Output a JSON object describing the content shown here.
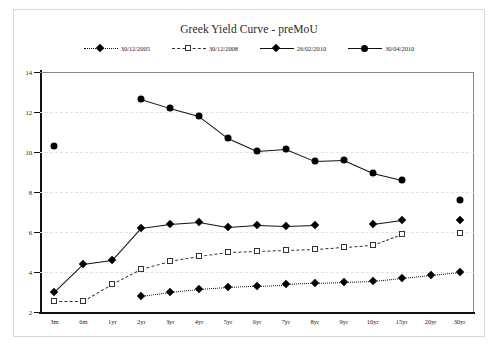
{
  "chart_data": {
    "type": "line",
    "title": "Greek Yield Curve - preMoU",
    "xlabel": "",
    "ylabel": "",
    "ylim": [
      2,
      14
    ],
    "ytick_step": 2,
    "yticks": [
      2,
      4,
      6,
      8,
      10,
      12,
      14
    ],
    "grid": true,
    "legend_position": "top",
    "categories": [
      "3m",
      "6m",
      "1yr",
      "2yr",
      "3yr",
      "4yr",
      "5yr",
      "6yr",
      "7yr",
      "8yr",
      "9yr",
      "10yr",
      "15yr",
      "20yr",
      "30yr"
    ],
    "series": [
      {
        "name": "30/12/2005",
        "marker": "diamond",
        "line": "dotted",
        "color": "#111111",
        "values": [
          null,
          null,
          null,
          2.8,
          3.0,
          3.15,
          3.25,
          3.32,
          3.38,
          3.45,
          3.5,
          3.55,
          3.7,
          3.85,
          4.0
        ]
      },
      {
        "name": "30/12/2008",
        "marker": "square-open",
        "line": "dashed",
        "color": "#333333",
        "values": [
          2.55,
          2.55,
          3.4,
          4.15,
          4.55,
          4.8,
          5.0,
          5.05,
          5.1,
          5.15,
          5.25,
          5.35,
          5.9,
          null,
          5.95
        ]
      },
      {
        "name": "26/02/2010",
        "marker": "diamond",
        "line": "solid",
        "color": "#111111",
        "values": [
          3.0,
          4.4,
          4.6,
          6.2,
          6.4,
          6.5,
          6.25,
          6.35,
          6.3,
          6.35,
          null,
          6.4,
          6.6,
          null,
          6.6
        ]
      },
      {
        "name": "30/04/2010",
        "marker": "circle",
        "line": "solid",
        "color": "#111111",
        "values": [
          10.3,
          null,
          null,
          12.65,
          12.2,
          11.8,
          10.7,
          10.05,
          10.15,
          9.55,
          9.6,
          8.95,
          8.6,
          null,
          7.6
        ]
      }
    ]
  }
}
